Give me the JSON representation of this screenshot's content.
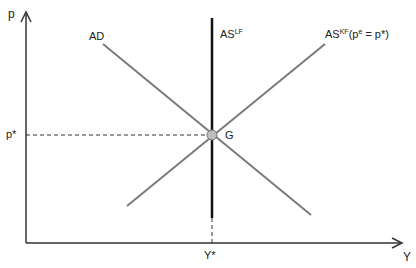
{
  "diagram": {
    "axes": {
      "y_label": "p",
      "x_label": "Y"
    },
    "curves": {
      "ad": {
        "label": "AD"
      },
      "as_lf": {
        "label_main": "AS",
        "label_sup": "LF"
      },
      "as_kf": {
        "label_main": "AS",
        "label_sup": "KF",
        "condition_prefix": "(p",
        "condition_sup": "e",
        "condition_suffix": " = p*)"
      }
    },
    "equilibrium": {
      "label": "G"
    },
    "ticks": {
      "p_star": "p*",
      "y_star": "Y*"
    },
    "colors": {
      "axis": "#333333",
      "ad_line": "#7a7a7a",
      "as_kf_line": "#7a7a7a",
      "as_lf_line": "#111111",
      "point_fill": "#bdbdbd"
    }
  }
}
